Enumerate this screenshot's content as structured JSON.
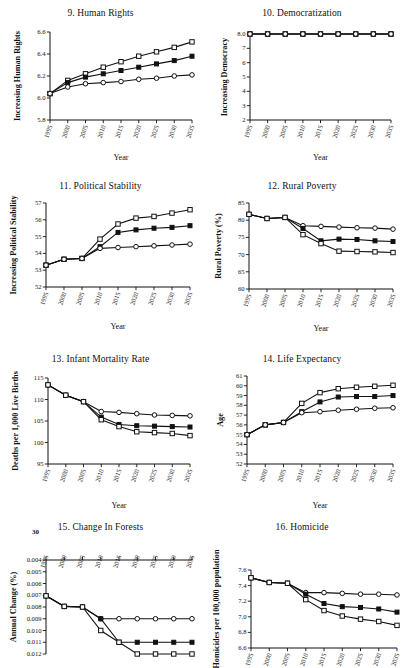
{
  "figure": {
    "background": "#ffffff",
    "line_color": "#111111",
    "stray_text": "30"
  },
  "common": {
    "x_label": "Year",
    "x_ticks": [
      "1995",
      "2000",
      "2005",
      "2010",
      "2015",
      "2020",
      "2025",
      "2030",
      "2035"
    ],
    "x_values": [
      1995,
      2000,
      2005,
      2010,
      2015,
      2020,
      2025,
      2030,
      2035
    ],
    "series_names": [
      "open-square",
      "filled-square",
      "open-circle"
    ]
  },
  "chart_data": [
    {
      "id": "panel-9",
      "type": "line",
      "title": "9. Human Rights",
      "xlabel": "Year",
      "ylabel": "Increasing Human Rights",
      "x": [
        1995,
        2000,
        2005,
        2010,
        2015,
        2020,
        2025,
        2030,
        2035
      ],
      "xtick_labels": [
        "1995",
        "2000",
        "2005",
        "2010",
        "2015",
        "2020",
        "2025",
        "2030",
        "2035"
      ],
      "ylim": [
        5.8,
        6.6
      ],
      "ytick_labels": [
        "5.8",
        "6.0",
        "6.2",
        "6.4",
        "6.6"
      ],
      "yticks": [
        5.8,
        6.0,
        6.2,
        6.4,
        6.6
      ],
      "grid": false,
      "legend": "none",
      "series": [
        {
          "name": "open-square",
          "marker": "open-square",
          "values": [
            6.04,
            6.16,
            6.22,
            6.28,
            6.33,
            6.38,
            6.42,
            6.46,
            6.51
          ]
        },
        {
          "name": "filled-square",
          "marker": "filled-square",
          "values": [
            6.04,
            6.14,
            6.19,
            6.22,
            6.25,
            6.28,
            6.31,
            6.34,
            6.38
          ]
        },
        {
          "name": "open-circle",
          "marker": "open-circle",
          "values": [
            6.04,
            6.1,
            6.13,
            6.14,
            6.15,
            6.17,
            6.18,
            6.2,
            6.21
          ]
        }
      ]
    },
    {
      "id": "panel-10",
      "type": "line",
      "title": "10. Democratization",
      "xlabel": "Year",
      "ylabel": "Increasing Democracy",
      "x": [
        1995,
        2000,
        2005,
        2010,
        2015,
        2020,
        2025,
        2030,
        2035
      ],
      "xtick_labels": [
        "1995",
        "2000",
        "2005",
        "2010",
        "2015",
        "2020",
        "2025",
        "2030",
        "2035"
      ],
      "ylim": [
        2,
        8
      ],
      "ytick_labels": [
        "2",
        "3",
        "4",
        "5",
        "6",
        "7",
        "8.0"
      ],
      "yticks": [
        2,
        3,
        4,
        5,
        6,
        7,
        8
      ],
      "grid": false,
      "legend": "none",
      "series": [
        {
          "name": "open-square",
          "marker": "open-square",
          "values": [
            8,
            8,
            8,
            8,
            8,
            8,
            8,
            8,
            8
          ]
        },
        {
          "name": "filled-square",
          "marker": "filled-square",
          "values": [
            8,
            8,
            8,
            8,
            8,
            8,
            8,
            8,
            8
          ]
        },
        {
          "name": "open-circle",
          "marker": "open-circle",
          "values": [
            8,
            8,
            8,
            8,
            8,
            8,
            8,
            8,
            8
          ]
        }
      ]
    },
    {
      "id": "panel-11",
      "type": "line",
      "title": "11. Political Stability",
      "xlabel": "Year",
      "ylabel": "Increasing Political Stability",
      "x": [
        1995,
        2000,
        2005,
        2010,
        2015,
        2020,
        2025,
        2030,
        2035
      ],
      "xtick_labels": [
        "1995",
        "2000",
        "2005",
        "2010",
        "2015",
        "2020",
        "2025",
        "2030",
        "2035"
      ],
      "ylim": [
        52,
        57
      ],
      "ytick_labels": [
        "52",
        "53",
        "54",
        "55",
        "56",
        "57"
      ],
      "yticks": [
        52,
        53,
        54,
        55,
        56,
        57
      ],
      "grid": false,
      "legend": "none",
      "series": [
        {
          "name": "open-square",
          "marker": "open-square",
          "values": [
            53.3,
            53.65,
            53.7,
            54.85,
            55.75,
            56.1,
            56.2,
            56.4,
            56.6
          ]
        },
        {
          "name": "filled-square",
          "marker": "filled-square",
          "values": [
            53.3,
            53.65,
            53.7,
            54.4,
            55.25,
            55.4,
            55.5,
            55.55,
            55.65
          ]
        },
        {
          "name": "open-circle",
          "marker": "open-circle",
          "values": [
            53.3,
            53.65,
            53.7,
            54.3,
            54.35,
            54.4,
            54.45,
            54.5,
            54.55
          ]
        }
      ]
    },
    {
      "id": "panel-12",
      "type": "line",
      "title": "12. Rural Poverty",
      "xlabel": "Year",
      "ylabel": "Rural Poverty (%)",
      "x": [
        1995,
        2000,
        2005,
        2010,
        2015,
        2020,
        2025,
        2030,
        2035
      ],
      "xtick_labels": [
        "1995",
        "2000",
        "2005",
        "2010",
        "2015",
        "2020",
        "2025",
        "2030",
        "2035"
      ],
      "ylim": [
        60,
        85
      ],
      "ytick_labels": [
        "60",
        "65",
        "70",
        "75",
        "80",
        "85"
      ],
      "yticks": [
        60,
        65,
        70,
        75,
        80,
        85
      ],
      "grid": false,
      "legend": "none",
      "series": [
        {
          "name": "open-circle",
          "marker": "open-circle",
          "values": [
            81.7,
            80.5,
            80.8,
            78.4,
            78.2,
            78.0,
            77.8,
            77.7,
            77.4
          ]
        },
        {
          "name": "filled-square",
          "marker": "filled-square",
          "values": [
            81.7,
            80.5,
            80.8,
            77.6,
            74.0,
            74.5,
            74.4,
            74.0,
            73.8
          ]
        },
        {
          "name": "open-square",
          "marker": "open-square",
          "values": [
            81.7,
            80.5,
            80.8,
            75.8,
            73.2,
            71.0,
            70.9,
            70.8,
            70.6
          ]
        }
      ]
    },
    {
      "id": "panel-13",
      "type": "line",
      "title": "13. Infant Mortality Rate",
      "xlabel": "Year",
      "ylabel": "Deaths per 1,000 Live Births",
      "x": [
        1995,
        2000,
        2005,
        2010,
        2015,
        2020,
        2025,
        2030,
        2035
      ],
      "xtick_labels": [
        "1995",
        "2000",
        "2005",
        "2010",
        "2015",
        "2020",
        "2025",
        "2030",
        "2035"
      ],
      "ylim": [
        95,
        115
      ],
      "ytick_labels": [
        "95",
        "100",
        "105",
        "110",
        "115"
      ],
      "yticks": [
        95,
        100,
        105,
        110,
        115
      ],
      "grid": false,
      "legend": "none",
      "series": [
        {
          "name": "open-circle",
          "marker": "open-circle",
          "values": [
            113.4,
            111.0,
            109.5,
            107.2,
            107.0,
            106.7,
            106.4,
            106.3,
            106.2
          ]
        },
        {
          "name": "filled-square",
          "marker": "filled-square",
          "values": [
            113.4,
            111.0,
            109.5,
            105.9,
            104.2,
            103.9,
            103.8,
            103.7,
            103.6
          ]
        },
        {
          "name": "open-square",
          "marker": "open-square",
          "values": [
            113.4,
            111.0,
            109.5,
            105.3,
            103.7,
            102.5,
            102.3,
            102.1,
            101.6
          ]
        }
      ]
    },
    {
      "id": "panel-14",
      "type": "line",
      "title": "14. Life Expectancy",
      "xlabel": "Year",
      "ylabel": "Age",
      "x": [
        1995,
        2000,
        2005,
        2010,
        2015,
        2020,
        2025,
        2030,
        2035
      ],
      "xtick_labels": [
        "1995",
        "2000",
        "2005",
        "2010",
        "2015",
        "2020",
        "2025",
        "2030",
        "2035"
      ],
      "ylim": [
        52,
        61
      ],
      "ytick_labels": [
        "52",
        "53",
        "54",
        "55",
        "56",
        "57",
        "58",
        "59",
        "60",
        "61"
      ],
      "yticks": [
        52,
        53,
        54,
        55,
        56,
        57,
        58,
        59,
        60,
        61
      ],
      "grid": false,
      "legend": "none",
      "series": [
        {
          "name": "open-square",
          "marker": "open-square",
          "values": [
            55.0,
            56.0,
            56.25,
            58.2,
            59.3,
            59.7,
            59.85,
            59.95,
            60.05
          ]
        },
        {
          "name": "filled-square",
          "marker": "filled-square",
          "values": [
            55.0,
            56.0,
            56.25,
            57.35,
            58.35,
            58.85,
            58.9,
            58.9,
            59.0
          ]
        },
        {
          "name": "open-circle",
          "marker": "open-circle",
          "values": [
            55.0,
            56.0,
            56.25,
            57.25,
            57.35,
            57.5,
            57.6,
            57.7,
            57.75
          ]
        }
      ]
    },
    {
      "id": "panel-15",
      "type": "line",
      "title": "15. Change In Forests",
      "xlabel": "Year",
      "ylabel": "Annual Change (%)",
      "x": [
        1995,
        2000,
        2005,
        2010,
        2015,
        2020,
        2025,
        2030,
        2035
      ],
      "xtick_labels": [
        "1995",
        "2000",
        "2005",
        "2010",
        "2015",
        "2020",
        "2025",
        "2030",
        "2035"
      ],
      "x_axis_position": "top",
      "y_inverted": true,
      "ylim": [
        0.004,
        0.012
      ],
      "ytick_labels": [
        "0.004",
        "0.005",
        "0.006",
        "0.007",
        "0.008",
        "0.009",
        "0.010",
        "0.011",
        "0.012"
      ],
      "yticks": [
        0.004,
        0.005,
        0.006,
        0.007,
        0.008,
        0.009,
        0.01,
        0.011,
        0.012
      ],
      "grid": false,
      "legend": "none",
      "series": [
        {
          "name": "open-circle",
          "marker": "open-circle",
          "values": [
            0.00705,
            0.00795,
            0.008,
            0.009,
            0.009,
            0.009,
            0.009,
            0.009,
            0.009
          ]
        },
        {
          "name": "filled-square",
          "marker": "filled-square",
          "values": [
            0.00705,
            0.00795,
            0.008,
            0.009,
            0.011,
            0.011,
            0.011,
            0.011,
            0.011
          ]
        },
        {
          "name": "open-square",
          "marker": "open-square",
          "values": [
            0.00705,
            0.00795,
            0.008,
            0.01,
            0.011,
            0.012,
            0.012,
            0.012,
            0.012
          ]
        }
      ]
    },
    {
      "id": "panel-16",
      "type": "line",
      "title": "16. Homicide",
      "xlabel": "Year",
      "ylabel": "Homicides per 100,000 population",
      "x": [
        1995,
        2000,
        2005,
        2010,
        2015,
        2020,
        2025,
        2030,
        2035
      ],
      "xtick_labels": [
        "1995",
        "2000",
        "2005",
        "2010",
        "2015",
        "2020",
        "2025",
        "2030",
        "2035"
      ],
      "ylim": [
        6.6,
        7.6
      ],
      "ytick_labels": [
        "6.6",
        "6.8",
        "7.0",
        "7.2",
        "7.4",
        "7.6"
      ],
      "yticks": [
        6.6,
        6.8,
        7.0,
        7.2,
        7.4,
        7.6
      ],
      "grid": false,
      "legend": "none",
      "series": [
        {
          "name": "open-circle",
          "marker": "open-circle",
          "values": [
            7.5,
            7.44,
            7.43,
            7.31,
            7.31,
            7.3,
            7.29,
            7.29,
            7.28
          ]
        },
        {
          "name": "filled-square",
          "marker": "filled-square",
          "values": [
            7.5,
            7.44,
            7.43,
            7.29,
            7.17,
            7.13,
            7.12,
            7.1,
            7.06
          ]
        },
        {
          "name": "open-square",
          "marker": "open-square",
          "values": [
            7.5,
            7.44,
            7.43,
            7.22,
            7.08,
            7.01,
            6.97,
            6.94,
            6.89
          ]
        }
      ]
    }
  ]
}
